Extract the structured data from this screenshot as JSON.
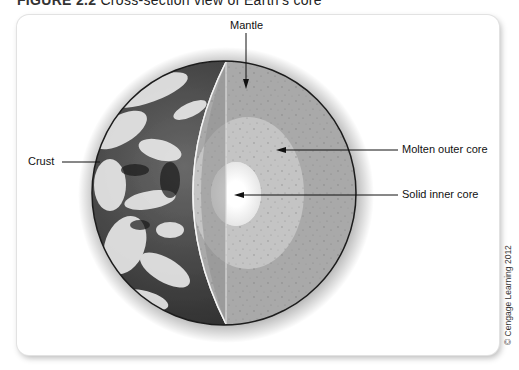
{
  "figure": {
    "number": "FIGURE 2.2",
    "caption": "Cross-section view of Earth's core"
  },
  "labels": {
    "mantle": "Mantle",
    "crust": "Crust",
    "outer_core": "Molten outer core",
    "inner_core": "Solid inner core"
  },
  "credit": "© Cengage Learning 2012",
  "colors": {
    "cut_face": "#8f8f8f",
    "mantle": "#a9a9a9",
    "outer_core": "#c4c4c4",
    "inner_core": "#f5f5f5",
    "leader_line": "#111111"
  }
}
